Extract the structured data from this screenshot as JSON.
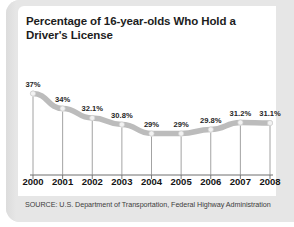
{
  "chart_data": {
    "type": "line",
    "title": "Percentage of 16-year-olds Who Hold a Driver's License",
    "xlabel": "",
    "ylabel": "",
    "categories": [
      "2000",
      "2001",
      "2002",
      "2003",
      "2004",
      "2005",
      "2006",
      "2007",
      "2008"
    ],
    "values": [
      37,
      34,
      32.1,
      30.8,
      29,
      29,
      29.8,
      31.2,
      31.1
    ],
    "value_labels": [
      "37%",
      "34%",
      "32.1%",
      "30.8%",
      "29%",
      "29%",
      "29.8%",
      "31.2%",
      "31.1%"
    ],
    "ylim": [
      0,
      40
    ],
    "grid": false,
    "legend": null,
    "source": "SOURCE: U.S. Department of Transportation, Federal Highway Administration",
    "series_color": "#bcbcbc",
    "marker_color": "#f2f2f2",
    "axis_color": "#6e6e6e",
    "label_color": "#262626",
    "frame_color": "#e3e3e3",
    "card_color": "#ffffff"
  }
}
